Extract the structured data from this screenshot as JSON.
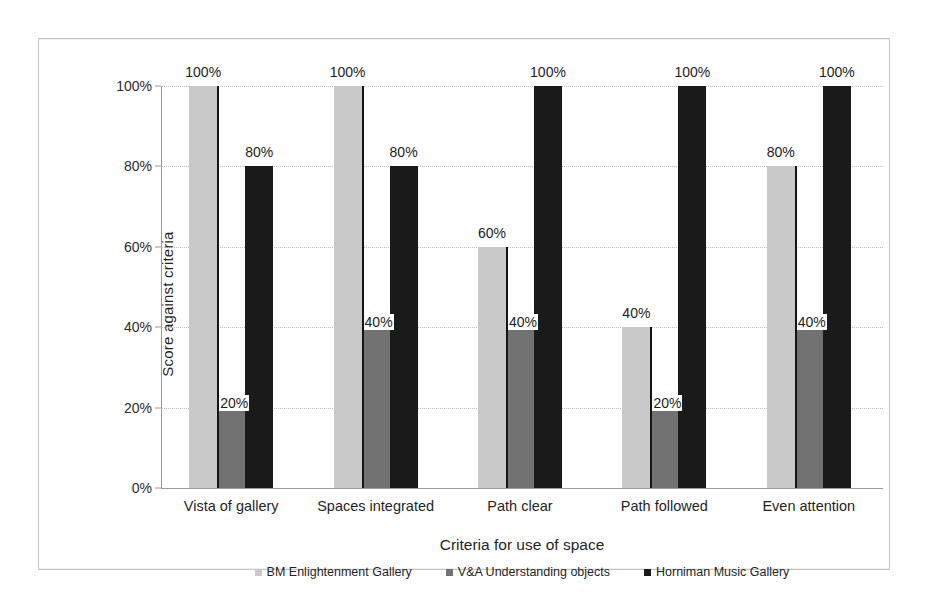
{
  "chart_data": {
    "type": "bar",
    "title": "",
    "xlabel": "Criteria for use of space",
    "ylabel": "Score against criteria",
    "ylim": [
      0,
      100
    ],
    "ytick_labels": [
      "0%",
      "20%",
      "40%",
      "60%",
      "80%",
      "100%"
    ],
    "ytick_values": [
      0,
      20,
      40,
      60,
      80,
      100
    ],
    "grid": true,
    "legend_position": "bottom",
    "categories": [
      "Vista of gallery",
      "Spaces integrated",
      "Path clear",
      "Path followed",
      "Even attention"
    ],
    "series": [
      {
        "name": "BM Enlightenment Gallery",
        "color": "#c9c9c9",
        "values": [
          100,
          100,
          60,
          40,
          80
        ],
        "data_labels": [
          "100%",
          "100%",
          "60%",
          "40%",
          "80%"
        ]
      },
      {
        "name": "V&A Understanding objects",
        "color": "#727272",
        "values": [
          20,
          40,
          40,
          20,
          40
        ],
        "data_labels": [
          "20%",
          "40%",
          "40%",
          "20%",
          "40%"
        ]
      },
      {
        "name": "Horniman Music Gallery",
        "color": "#1a1a1a",
        "values": [
          80,
          80,
          100,
          100,
          100
        ],
        "data_labels": [
          "80%",
          "80%",
          "100%",
          "100%",
          "100%"
        ]
      }
    ]
  }
}
